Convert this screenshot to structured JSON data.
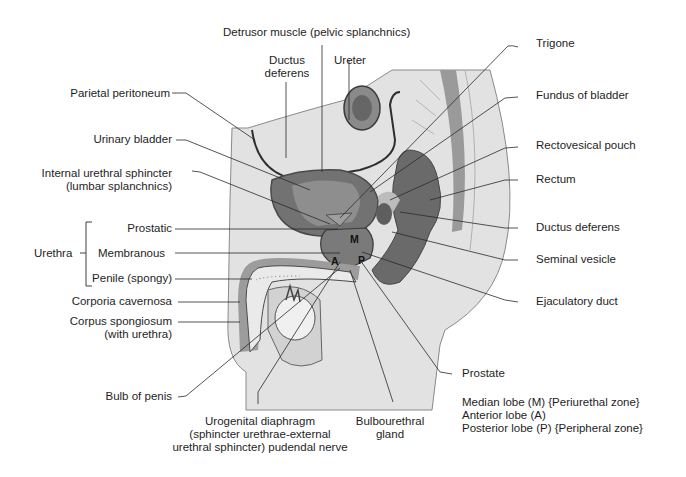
{
  "figure": {
    "labels": {
      "detrusor": "Detrusor muscle (pelvic splanchnics)",
      "ductus_deferens_top_1": "Ductus",
      "ductus_deferens_top_2": "deferens",
      "ureter": "Ureter",
      "trigone": "Trigone",
      "parietal_peritoneum": "Parietal peritoneum",
      "fundus": "Fundus of bladder",
      "urinary_bladder": "Urinary bladder",
      "rectovesical_pouch": "Rectovesical pouch",
      "internal_sphincter_1": "Internal urethral sphincter",
      "internal_sphincter_2": "(lumbar splanchnics)",
      "rectum": "Rectum",
      "urethra": "Urethra",
      "prostatic": "Prostatic",
      "membranous": "Membranous",
      "penile": "Penile (spongy)",
      "ductus_deferens_right": "Ductus deferens",
      "seminal_vesicle": "Seminal vesicle",
      "corpora_cavernosa": "Corporia cavernosa",
      "corpus_spongiosum_1": "Corpus spongiosum",
      "corpus_spongiosum_2": "(with urethra)",
      "ejaculatory_duct": "Ejaculatory duct",
      "bulb_of_penis": "Bulb of penis",
      "prostate": "Prostate",
      "urogenital_1": "Urogenital diaphragm",
      "urogenital_2": "(sphincter urethrae-external",
      "urogenital_3": "urethral sphincter) pudendal nerve",
      "bulbourethral_1": "Bulbourethral",
      "bulbourethral_2": "gland",
      "lobe_median": "Median lobe (M) {Periurethal zone}",
      "lobe_anterior": "Anterior lobe (A)",
      "lobe_posterior": "Posterior lobe (P) {Peripheral zone}"
    },
    "lobe_markers": {
      "a": "A",
      "m": "M",
      "p": "P"
    },
    "colors": {
      "background": "#ffffff",
      "body_light": "#e4e4e4",
      "body_mid": "#cfcfcf",
      "organ_dark": "#6f6f6f",
      "organ_mid": "#8e8e8e",
      "outline": "#3a3a3a",
      "leader": "#2a2a2a"
    }
  }
}
